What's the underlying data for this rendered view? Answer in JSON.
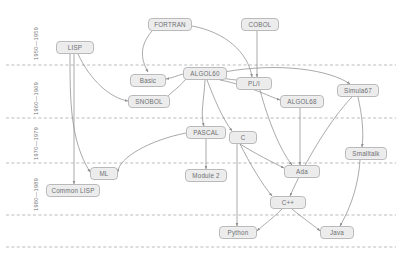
{
  "diagram": {
    "background": "#ffffff",
    "node_fill": "#ececed",
    "node_stroke": "#b9b9bb",
    "node_text_color": "#6f7072",
    "edge_color": "#8d8e90",
    "gridline_color": "#a8a9ab",
    "gridline_style": "dashed"
  },
  "axis": {
    "orientation": "vertical",
    "label_rotation": "-90deg",
    "eras": [
      {
        "label": "1950—1959",
        "x": 33,
        "y": 60,
        "band_top": 6,
        "band_bottom": 65
      },
      {
        "label": "1960—1969",
        "x": 33,
        "y": 115,
        "band_top": 65,
        "band_bottom": 118
      },
      {
        "label": "1970—1979",
        "x": 33,
        "y": 160,
        "band_top": 118,
        "band_bottom": 163
      },
      {
        "label": "1980—1989",
        "x": 33,
        "y": 211,
        "band_top": 163,
        "band_bottom": 215
      }
    ],
    "gridlines_y": [
      65,
      118,
      163,
      215,
      247
    ]
  },
  "nodes": [
    {
      "id": "lisp",
      "label": "LISP",
      "x": 56,
      "y": 41,
      "w": 38
    },
    {
      "id": "fortran",
      "label": "FORTRAN",
      "x": 148,
      "y": 18,
      "w": 44
    },
    {
      "id": "cobol",
      "label": "COBOL",
      "x": 241,
      "y": 18,
      "w": 38
    },
    {
      "id": "basic",
      "label": "Basic",
      "x": 130,
      "y": 74,
      "w": 36
    },
    {
      "id": "algol60",
      "label": "ALGOL60",
      "x": 183,
      "y": 67,
      "w": 44
    },
    {
      "id": "pli",
      "label": "PL/I",
      "x": 236,
      "y": 77,
      "w": 36
    },
    {
      "id": "snobol",
      "label": "SNOBOL",
      "x": 128,
      "y": 95,
      "w": 42
    },
    {
      "id": "algol68",
      "label": "ALGOL68",
      "x": 280,
      "y": 95,
      "w": 44
    },
    {
      "id": "simula67",
      "label": "Simula67",
      "x": 337,
      "y": 84,
      "w": 42
    },
    {
      "id": "pascal",
      "label": "PASCAL",
      "x": 186,
      "y": 126,
      "w": 40
    },
    {
      "id": "c",
      "label": "C",
      "x": 229,
      "y": 131,
      "w": 28
    },
    {
      "id": "smalltalk",
      "label": "Smalltalk",
      "x": 345,
      "y": 147,
      "w": 42
    },
    {
      "id": "ml",
      "label": "ML",
      "x": 90,
      "y": 167,
      "w": 28
    },
    {
      "id": "module2",
      "label": "Module 2",
      "x": 185,
      "y": 169,
      "w": 42
    },
    {
      "id": "ada",
      "label": "Ada",
      "x": 284,
      "y": 165,
      "w": 36
    },
    {
      "id": "commonlisp",
      "label": "Common LISP",
      "x": 46,
      "y": 184,
      "w": 54
    },
    {
      "id": "cpp",
      "label": "C++",
      "x": 270,
      "y": 196,
      "w": 36
    },
    {
      "id": "python",
      "label": "Python",
      "x": 219,
      "y": 226,
      "w": 38
    },
    {
      "id": "java",
      "label": "Java",
      "x": 320,
      "y": 226,
      "w": 34
    }
  ],
  "edges": [
    {
      "from": "lisp",
      "to": "ml",
      "path": "M 70 54 C 70 100 70 140 90 172"
    },
    {
      "from": "lisp",
      "to": "commonlisp",
      "path": "M 74 54 L 74 184"
    },
    {
      "from": "lisp",
      "to": "snobol",
      "path": "M 78 54 C 90 80 110 98 128 101"
    },
    {
      "from": "fortran",
      "to": "algol60",
      "path": "M 152 31 C 140 45 140 58 148 72"
    },
    {
      "from": "fortran",
      "to": "pli",
      "path": "M 192 26 C 225 32 248 52 252 77"
    },
    {
      "from": "cobol",
      "to": "pli",
      "path": "M 257 31 L 257 77"
    },
    {
      "from": "algol60",
      "to": "pli",
      "path": "M 222 78 C 232 80 238 80 240 80"
    },
    {
      "from": "algol60",
      "to": "basic",
      "path": "M 183 74 C 176 76 172 78 166 79"
    },
    {
      "from": "algol60",
      "to": "snobol",
      "path": "M 186 79 C 175 92 160 99 170 100"
    },
    {
      "from": "algol60",
      "to": "algol68",
      "path": "M 220 80 C 250 86 268 96 280 100"
    },
    {
      "from": "algol60",
      "to": "simula67",
      "path": "M 224 72 C 280 62 330 70 350 84"
    },
    {
      "from": "algol60",
      "to": "pascal",
      "path": "M 205 80 C 204 100 200 115 204 126"
    },
    {
      "from": "algol60",
      "to": "c",
      "path": "M 207 80 C 214 98 222 118 232 131"
    },
    {
      "from": "pli",
      "to": "ada",
      "path": "M 260 90 C 268 120 280 150 292 165"
    },
    {
      "from": "algol68",
      "to": "ada",
      "path": "M 300 108 L 300 165"
    },
    {
      "from": "simula67",
      "to": "cpp",
      "path": "M 352 97 C 330 120 306 160 290 196"
    },
    {
      "from": "simula67",
      "to": "smalltalk",
      "path": "M 358 97 C 362 115 364 132 362 147"
    },
    {
      "from": "pascal",
      "to": "ml",
      "path": "M 186 133 C 150 140 118 158 118 172"
    },
    {
      "from": "pascal",
      "to": "module2",
      "path": "M 206 139 L 206 169"
    },
    {
      "from": "c",
      "to": "ada",
      "path": "M 240 144 C 256 154 272 162 284 168"
    },
    {
      "from": "c",
      "to": "cpp",
      "path": "M 240 144 C 250 164 262 184 272 196"
    },
    {
      "from": "c",
      "to": "python",
      "path": "M 237 144 L 237 226"
    },
    {
      "from": "smalltalk",
      "to": "java",
      "path": "M 360 160 C 358 190 348 212 340 226"
    },
    {
      "from": "cpp",
      "to": "python",
      "path": "M 282 209 C 272 219 262 226 257 231"
    },
    {
      "from": "cpp",
      "to": "java",
      "path": "M 292 209 C 304 219 316 227 320 231"
    }
  ]
}
